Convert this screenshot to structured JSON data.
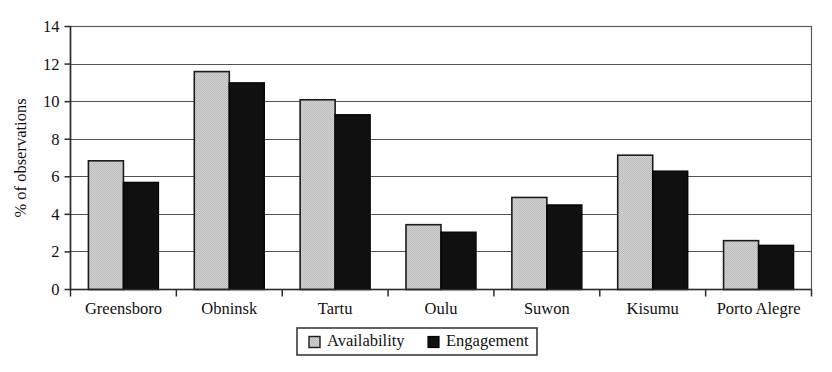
{
  "chart_data": {
    "type": "bar",
    "title": "",
    "subtitle": "",
    "xlabel": "",
    "ylabel": "% of observations",
    "ylim": [
      0,
      14
    ],
    "ytick_step": 2,
    "yticks": [
      "0",
      "2",
      "4",
      "6",
      "8",
      "10",
      "12",
      "14"
    ],
    "grid": true,
    "legend_position": "bottom-center",
    "categories": [
      "Greensboro",
      "Obninsk",
      "Tartu",
      "Oulu",
      "Suwon",
      "Kisumu",
      "Porto Alegre"
    ],
    "series": [
      {
        "name": "Availability",
        "color": "#c9c9c9",
        "values": [
          6.85,
          11.6,
          10.1,
          3.45,
          4.9,
          7.15,
          2.6
        ]
      },
      {
        "name": "Engagement",
        "color": "#101010",
        "values": [
          5.7,
          11.0,
          9.3,
          3.05,
          4.5,
          6.3,
          2.35
        ]
      }
    ]
  },
  "legend": {
    "items": [
      {
        "label": "Availability",
        "swatch": "light-gray-square"
      },
      {
        "label": "Engagement",
        "swatch": "black-square"
      }
    ]
  },
  "colors": {
    "availability_fill": "#c9c9c9",
    "engagement_fill": "#101010",
    "bar_outline": "#1c1c1c",
    "gridline": "#54544f",
    "axis": "#2b2b2b",
    "background": "#ffffff",
    "text": "#111111"
  }
}
